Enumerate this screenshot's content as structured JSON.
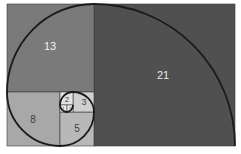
{
  "diagram": {
    "squares": [
      {
        "label": "21",
        "size": 21,
        "color": "#505050",
        "text_color": "#e8e8e8"
      },
      {
        "label": "13",
        "size": 13,
        "color": "#7a7a7a",
        "text_color": "#f0f0f0"
      },
      {
        "label": "8",
        "size": 8,
        "color": "#a8a8a8",
        "text_color": "#404040"
      },
      {
        "label": "5",
        "size": 5,
        "color": "#b8b8b8",
        "text_color": "#404040"
      },
      {
        "label": "3",
        "size": 3,
        "color": "#d0d0d0",
        "text_color": "#404040"
      },
      {
        "label": "2",
        "size": 2,
        "color": "#e2e2e2",
        "text_color": "#404040"
      },
      {
        "label": "1",
        "size": 1,
        "color": "#f0f0f0",
        "text_color": "#404040"
      },
      {
        "label": "1",
        "size": 1,
        "color": "#f0f0f0",
        "text_color": "#404040"
      }
    ],
    "spiral_color": "#1a1a1a"
  }
}
